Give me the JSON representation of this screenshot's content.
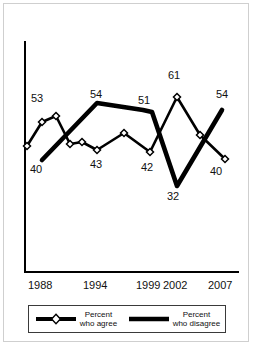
{
  "chart_data": {
    "type": "line",
    "title": "",
    "subtitle": "",
    "xlabel": "",
    "ylabel": "",
    "grid": false,
    "legend_position": "bottom",
    "x_tick_labels": [
      "1988",
      "1994",
      "1999",
      "2002",
      "2007"
    ],
    "x_tick_positions_px": [
      42,
      97,
      150,
      177,
      222
    ],
    "axis": {
      "y_axis_top_px": 42,
      "y_axis_bottom_px": 272,
      "x_axis_left_px": 25,
      "x_axis_right_px": 238,
      "ylim": [
        28,
        66
      ],
      "xlim_years": [
        1987,
        2007
      ]
    },
    "series": [
      {
        "name": "Percent who agree",
        "style": "thin-line-with-open-diamond-markers",
        "color": "#000000",
        "marker": "open-diamond",
        "points": [
          {
            "x_px": 27,
            "y_px": 146,
            "value": 47,
            "label": ""
          },
          {
            "x_px": 42,
            "y_px": 122,
            "value": 53,
            "label": "53"
          },
          {
            "x_px": 56,
            "y_px": 116,
            "value": 54,
            "label": ""
          },
          {
            "x_px": 70,
            "y_px": 144,
            "value": 47,
            "label": ""
          },
          {
            "x_px": 82,
            "y_px": 142,
            "value": 47,
            "label": ""
          },
          {
            "x_px": 97,
            "y_px": 150,
            "value": 43,
            "label": "43"
          },
          {
            "x_px": 124,
            "y_px": 133,
            "value": 49,
            "label": ""
          },
          {
            "x_px": 150,
            "y_px": 152,
            "value": 42,
            "label": "42"
          },
          {
            "x_px": 177,
            "y_px": 97,
            "value": 61,
            "label": "61"
          },
          {
            "x_px": 200,
            "y_px": 135,
            "value": 49,
            "label": ""
          },
          {
            "x_px": 225,
            "y_px": 159,
            "value": 40,
            "label": "40"
          }
        ],
        "labeled_values": [
          53,
          43,
          42,
          61,
          40
        ]
      },
      {
        "name": "Percent who disagree",
        "style": "thick-solid-line",
        "color": "#000000",
        "marker": "none",
        "points": [
          {
            "x_px": 42,
            "y_px": 160,
            "value": 40,
            "label": "40"
          },
          {
            "x_px": 97,
            "y_px": 103,
            "value": 54,
            "label": "54"
          },
          {
            "x_px": 143,
            "y_px": 110,
            "value": 51,
            "label": "51"
          },
          {
            "x_px": 152,
            "y_px": 112,
            "value": 51,
            "label": ""
          },
          {
            "x_px": 177,
            "y_px": 186,
            "value": 32,
            "label": "32"
          },
          {
            "x_px": 222,
            "y_px": 110,
            "value": 54,
            "label": "54"
          }
        ],
        "labeled_values": [
          40,
          54,
          51,
          32,
          54
        ]
      }
    ],
    "annotations": [
      {
        "text": "53",
        "x_px": 31,
        "y_px": 92,
        "series": "Percent who agree"
      },
      {
        "text": "40",
        "x_px": 30,
        "y_px": 163,
        "series": "Percent who disagree"
      },
      {
        "text": "54",
        "x_px": 90,
        "y_px": 88,
        "series": "Percent who disagree"
      },
      {
        "text": "43",
        "x_px": 90,
        "y_px": 158,
        "series": "Percent who agree"
      },
      {
        "text": "51",
        "x_px": 138,
        "y_px": 94,
        "series": "Percent who disagree"
      },
      {
        "text": "42",
        "x_px": 141,
        "y_px": 161,
        "series": "Percent who agree"
      },
      {
        "text": "61",
        "x_px": 168,
        "y_px": 69,
        "series": "Percent who agree"
      },
      {
        "text": "32",
        "x_px": 167,
        "y_px": 190,
        "series": "Percent who disagree"
      },
      {
        "text": "54",
        "x_px": 216,
        "y_px": 88,
        "series": "Percent who disagree"
      },
      {
        "text": "40",
        "x_px": 210,
        "y_px": 165,
        "series": "Percent who agree"
      }
    ]
  },
  "legend": {
    "entries": [
      {
        "id": "agree",
        "line1": "Percent",
        "line2": "who agree",
        "swatch": "thick-line-with-open-diamond-marker"
      },
      {
        "id": "disagree",
        "line1": "Percent",
        "line2": "who disagree",
        "swatch": "thick-line"
      }
    ]
  },
  "colors": {
    "ink": "#000000",
    "text": "#111111",
    "frame": "#cfcfcf",
    "legend_border": "#3a3a3a",
    "background": "#ffffff",
    "marker_fill": "#ffffff"
  }
}
